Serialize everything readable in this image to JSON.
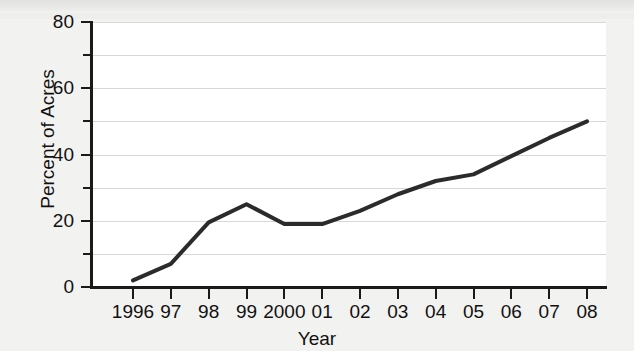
{
  "chart_data": {
    "type": "line",
    "title": "",
    "xlabel": "Year",
    "ylabel": "Percent of Acres",
    "categories": [
      "1996",
      "97",
      "98",
      "99",
      "2000",
      "01",
      "02",
      "03",
      "04",
      "05",
      "06",
      "07",
      "08"
    ],
    "x": [
      1996,
      1997,
      1998,
      1999,
      2000,
      2001,
      2002,
      2003,
      2004,
      2005,
      2006,
      2007,
      2008
    ],
    "values": [
      2,
      7,
      19.5,
      25,
      19,
      19,
      23,
      28,
      32,
      34,
      39.5,
      45,
      50
    ],
    "series": [
      {
        "name": "Percent of Acres",
        "values": [
          2,
          7,
          19.5,
          25,
          19,
          19,
          23,
          28,
          32,
          34,
          39.5,
          45,
          50
        ],
        "color": "#2b2b2b",
        "line_width": 4,
        "markers": false
      }
    ],
    "ylim": [
      0,
      80
    ],
    "xlim": [
      1996,
      2008
    ],
    "y_major_ticks": [
      0,
      20,
      40,
      60,
      80
    ],
    "y_minor_ticks": [
      10,
      30,
      50,
      70
    ],
    "y_tick_labels": [
      "0",
      "20",
      "40",
      "60",
      "80"
    ],
    "gridlines": {
      "horizontal": [
        10,
        20,
        30,
        40,
        50,
        60,
        70,
        80
      ],
      "vertical": false,
      "color": "#d8d8d8"
    },
    "legend": null,
    "legend_position": "none",
    "annotations": [],
    "plot_background": "#ffffff",
    "figure_background": "#f2f2f0",
    "axis_color": "#1a1a1a"
  },
  "axes": {
    "y_title": "Percent of Acres",
    "x_title": "Year",
    "y_ticks": [
      {
        "value": 80,
        "label": "80",
        "major": true
      },
      {
        "value": 70,
        "label": "",
        "major": false
      },
      {
        "value": 60,
        "label": "60",
        "major": true
      },
      {
        "value": 50,
        "label": "",
        "major": false
      },
      {
        "value": 40,
        "label": "40",
        "major": true
      },
      {
        "value": 30,
        "label": "",
        "major": false
      },
      {
        "value": 20,
        "label": "20",
        "major": true
      },
      {
        "value": 10,
        "label": "",
        "major": false
      },
      {
        "value": 0,
        "label": "0",
        "major": true
      }
    ],
    "x_ticks": [
      {
        "value": 1996,
        "label": "1996"
      },
      {
        "value": 1997,
        "label": "97"
      },
      {
        "value": 1998,
        "label": "98"
      },
      {
        "value": 1999,
        "label": "99"
      },
      {
        "value": 2000,
        "label": "2000"
      },
      {
        "value": 2001,
        "label": "01"
      },
      {
        "value": 2002,
        "label": "02"
      },
      {
        "value": 2003,
        "label": "03"
      },
      {
        "value": 2004,
        "label": "04"
      },
      {
        "value": 2005,
        "label": "05"
      },
      {
        "value": 2006,
        "label": "06"
      },
      {
        "value": 2007,
        "label": "07"
      },
      {
        "value": 2008,
        "label": "08"
      }
    ]
  }
}
